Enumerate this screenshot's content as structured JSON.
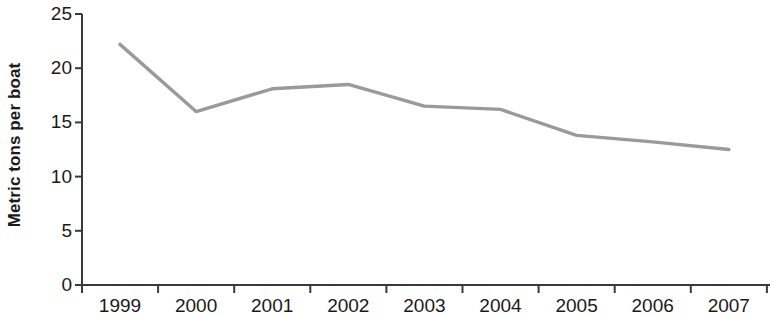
{
  "chart_data": {
    "type": "line",
    "title": "",
    "subtitle": "",
    "xlabel": "",
    "ylabel": "Metric tons per boat",
    "x": [
      "1999",
      "2000",
      "2001",
      "2002",
      "2003",
      "2004",
      "2005",
      "2006",
      "2007"
    ],
    "categories": [
      "1999",
      "2000",
      "2001",
      "2002",
      "2003",
      "2004",
      "2005",
      "2006",
      "2007"
    ],
    "values": [
      22.2,
      16.0,
      18.1,
      18.5,
      16.5,
      16.2,
      13.8,
      13.2,
      12.5
    ],
    "series": [
      {
        "name": "Metric tons per boat",
        "values": [
          22.2,
          16.0,
          18.1,
          18.5,
          16.5,
          16.2,
          13.8,
          13.2,
          12.5
        ],
        "color": "#9a9a9a"
      }
    ],
    "ylim": [
      0,
      25
    ],
    "yticks": [
      0,
      5,
      10,
      15,
      20,
      25
    ],
    "ytick_labels": [
      "0",
      "5",
      "10",
      "15",
      "20",
      "25"
    ],
    "xtick_labels": [
      "1999",
      "2000",
      "2001",
      "2002",
      "2003",
      "2004",
      "2005",
      "2006",
      "2007"
    ],
    "grid": false,
    "legend": false,
    "legend_position": "none",
    "markers": false,
    "line_color": "#9a9a9a",
    "axis_color": "#3a3a3a",
    "background_color": "#ffffff",
    "annotations": []
  }
}
